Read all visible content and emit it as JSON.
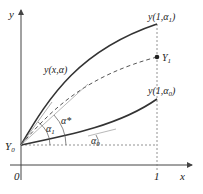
{
  "diagram": {
    "type": "shooting-method",
    "axes": {
      "x_label": "x",
      "y_label": "y",
      "origin_label": "0",
      "x_tick_label": "1"
    },
    "points": {
      "start": "Y",
      "start_sub": "0",
      "target": "Y",
      "target_sub": "1"
    },
    "curves": {
      "upper_end": "y(1,α",
      "upper_end_sub": "1",
      "upper_end_close": ")",
      "lower_end": "y(1,α",
      "lower_end_sub": "0",
      "lower_end_close": ")",
      "general": "y(x,α)"
    },
    "angles": {
      "alpha1": "α",
      "alpha1_sub": "1",
      "alpha_star": "α*",
      "alpha0": "α",
      "alpha0_sub": "0"
    },
    "colors": {
      "line": "#333333",
      "axis": "#444444",
      "dashed": "#555555"
    }
  }
}
